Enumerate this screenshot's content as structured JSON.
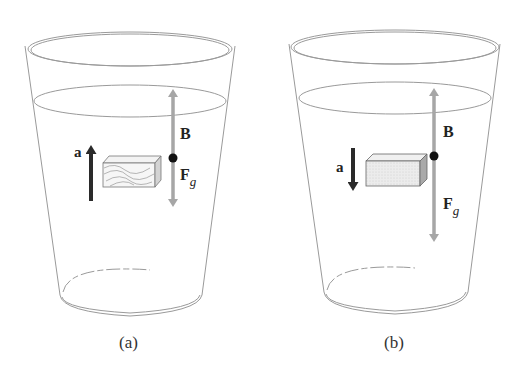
{
  "figure": {
    "panels": [
      {
        "id": "a",
        "caption": "(a)",
        "block": "wood",
        "acceleration": {
          "label": "a",
          "direction": "up"
        },
        "forces": [
          {
            "label": "B",
            "direction": "up"
          },
          {
            "label": "F",
            "subscript": "g",
            "direction": "down"
          }
        ]
      },
      {
        "id": "b",
        "caption": "(b)",
        "block": "dense",
        "acceleration": {
          "label": "a",
          "direction": "down"
        },
        "forces": [
          {
            "label": "B",
            "direction": "up"
          },
          {
            "label": "F",
            "subscript": "g",
            "direction": "down"
          }
        ]
      }
    ],
    "colors": {
      "glass": "#9a9a9a",
      "force_arrow": "#a6a6a6",
      "accel_arrow": "#2a2a2a",
      "block_face": "#e9e9e9",
      "block_side": "#bdbdbd"
    }
  }
}
